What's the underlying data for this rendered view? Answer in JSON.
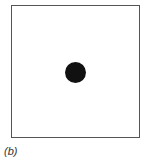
{
  "figure": {
    "label": "(b)",
    "frame": {
      "shape": "square",
      "border_color": "#555555"
    },
    "dot": {
      "shape": "circle",
      "color": "#111111",
      "position": "center"
    }
  }
}
